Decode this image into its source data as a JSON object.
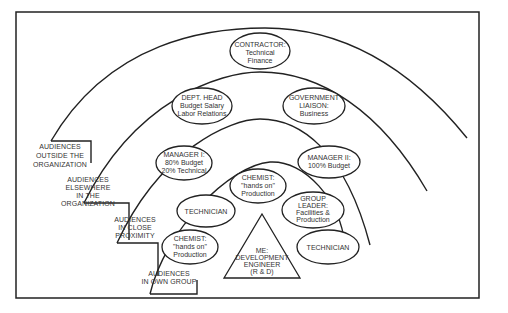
{
  "diagram": {
    "levels": [
      {
        "id": "outside",
        "label_lines": [
          "AUDIENCES",
          "OUTSIDE THE",
          "ORGANIZATION"
        ]
      },
      {
        "id": "elsewhere",
        "label_lines": [
          "AUDIENCES",
          "ELSEWHERE",
          "IN THE",
          "ORGANIZATION"
        ]
      },
      {
        "id": "close",
        "label_lines": [
          "AUDIENCES",
          "IN CLOSE",
          "PROXIMITY"
        ]
      },
      {
        "id": "own",
        "label_lines": [
          "AUDIENCES",
          "IN OWN GROUP"
        ]
      }
    ],
    "nodes": {
      "contractor": [
        "CONTRACTOR:",
        "Technical",
        "Finance"
      ],
      "dept_head": [
        "DEPT. HEAD",
        "Budget Salary",
        "Labor Relations"
      ],
      "gov_liaison": [
        "GOVERNMENT",
        "LIAISON:",
        "Business"
      ],
      "manager1": [
        "MANAGER I:",
        "80% Budget",
        "20% Technical"
      ],
      "manager2": [
        "MANAGER II:",
        "100% Budget"
      ],
      "chemist_top": [
        "CHEMIST:",
        "\"hands on\"",
        "Production"
      ],
      "technician_left": [
        "TECHNICIAN"
      ],
      "group_leader": [
        "GROUP",
        "LEADER:",
        "Facilities &",
        "Production"
      ],
      "chemist_bottom": [
        "CHEMIST:",
        "\"hands on\"",
        "Production"
      ],
      "technician_right": [
        "TECHNICIAN"
      ],
      "me": [
        "ME:",
        "DEVELOPMENT",
        "ENGINEER",
        "(R & D)"
      ]
    }
  }
}
